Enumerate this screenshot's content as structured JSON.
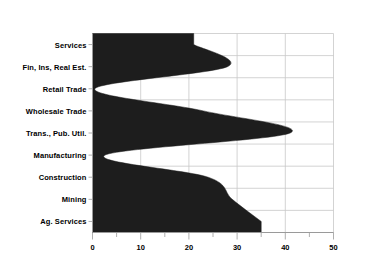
{
  "chart_data": {
    "type": "area",
    "orientation": "horizontal",
    "title": "",
    "subtitle": "",
    "xlabel": "",
    "ylabel": "",
    "categories": [
      "Services",
      "Fin, Ins, Real Est.",
      "Retail Trade",
      "Wholesale Trade",
      "Trans., Pub. Util.",
      "Manufacturing",
      "Construction",
      "Mining",
      "Ag. Services"
    ],
    "values": [
      21,
      28,
      0.5,
      23,
      41,
      2.6,
      24,
      29,
      35
    ],
    "xlim": [
      0,
      50
    ],
    "xticks": [
      0,
      10,
      20,
      30,
      40,
      50
    ],
    "xticklabels": [
      "0",
      "10",
      "20",
      "30",
      "40",
      "50"
    ],
    "minor_tick_step": 5,
    "grid": true,
    "legend": false,
    "interpolation": "spline",
    "fill_color": "#1d1d1d",
    "grid_color": "#c8c8c8",
    "axis_color": "#9a9a9a",
    "text_color": "#000000"
  }
}
